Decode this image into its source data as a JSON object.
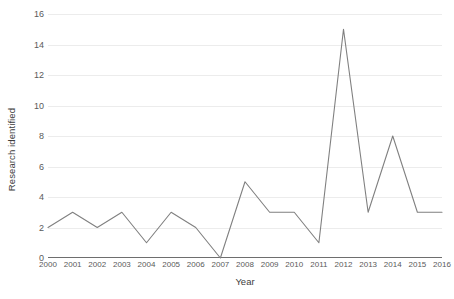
{
  "chart_data": {
    "type": "line",
    "title": "",
    "xlabel": "Year",
    "ylabel": "Research identified",
    "categories": [
      "2000",
      "2001",
      "2002",
      "2003",
      "2004",
      "2005",
      "2006",
      "2007",
      "2008",
      "2009",
      "2010",
      "2011",
      "2012",
      "2013",
      "2014",
      "2015",
      "2016"
    ],
    "values": [
      2,
      3,
      2,
      3,
      1,
      3,
      2,
      0,
      5,
      3,
      3,
      1,
      15,
      3,
      8,
      3,
      3
    ],
    "series": [
      {
        "name": "Research identified",
        "values": [
          2,
          3,
          2,
          3,
          1,
          3,
          2,
          0,
          5,
          3,
          3,
          1,
          15,
          3,
          8,
          3,
          3
        ]
      }
    ],
    "ylim": [
      0,
      16
    ],
    "yticks": [
      0,
      2,
      4,
      6,
      8,
      10,
      12,
      14,
      16
    ],
    "ytick_labels": [
      "0",
      "2",
      "4",
      "6",
      "8",
      "10",
      "12",
      "14",
      "16"
    ],
    "xlim": [
      2000,
      2016
    ],
    "grid": true,
    "grid_axis": "y",
    "legend": false,
    "legend_position": "none",
    "markers": false,
    "line_color": "#808080",
    "grid_color": "#ececec",
    "axis_color": "#6e6e6e",
    "background_color": "#ffffff",
    "text_color": "#5a5a5a"
  }
}
